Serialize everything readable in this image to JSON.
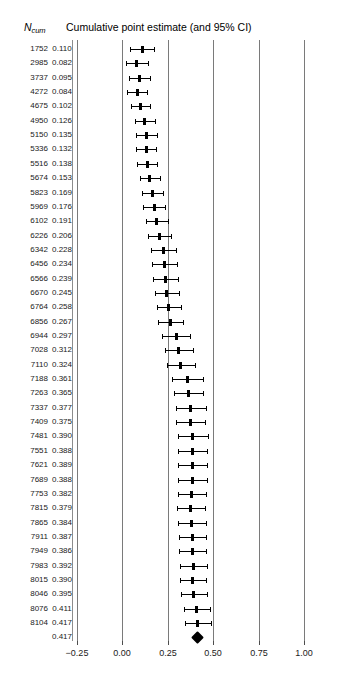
{
  "header": {
    "ncum_main": "N",
    "ncum_sub": "cum",
    "title": "Cumulative point estimate (and 95% CI)"
  },
  "axis": {
    "ticks": [
      "−0.25",
      "0.00",
      "0.25",
      "0.50",
      "0.75",
      "1.00"
    ],
    "tick_values": [
      -0.25,
      0.0,
      0.25,
      0.5,
      0.75,
      1.0
    ]
  },
  "columns": {
    "n_header": "Ncum",
    "estimate_header": "Cumulative point estimate (and 95% CI)"
  },
  "chart_data": {
    "type": "forest",
    "title": "Cumulative point estimate (and 95% CI)",
    "xlabel": "",
    "ylabel": "",
    "xlim": [
      -0.38,
      1.12
    ],
    "grid": true,
    "legend": "none",
    "x_ticks": [
      -0.25,
      0.0,
      0.25,
      0.5,
      0.75,
      1.0
    ],
    "x_tick_labels": [
      "−0.25",
      "0.00",
      "0.25",
      "0.50",
      "0.75",
      "1.00"
    ],
    "columns": [
      "N_cum",
      "estimate",
      "ci_low",
      "ci_high"
    ],
    "rows": [
      {
        "n": "1752",
        "estimate": "0.110",
        "value": 0.11,
        "ci_low": 0.042,
        "ci_high": 0.178
      },
      {
        "n": "2985",
        "estimate": "0.082",
        "value": 0.082,
        "ci_low": 0.022,
        "ci_high": 0.142
      },
      {
        "n": "3737",
        "estimate": "0.095",
        "value": 0.095,
        "ci_low": 0.038,
        "ci_high": 0.152
      },
      {
        "n": "4272",
        "estimate": "0.084",
        "value": 0.084,
        "ci_low": 0.029,
        "ci_high": 0.139
      },
      {
        "n": "4675",
        "estimate": "0.102",
        "value": 0.102,
        "ci_low": 0.049,
        "ci_high": 0.155
      },
      {
        "n": "4950",
        "estimate": "0.126",
        "value": 0.126,
        "ci_low": 0.069,
        "ci_high": 0.183
      },
      {
        "n": "5150",
        "estimate": "0.135",
        "value": 0.135,
        "ci_low": 0.079,
        "ci_high": 0.191
      },
      {
        "n": "5336",
        "estimate": "0.132",
        "value": 0.132,
        "ci_low": 0.078,
        "ci_high": 0.186
      },
      {
        "n": "5516",
        "estimate": "0.138",
        "value": 0.138,
        "ci_low": 0.085,
        "ci_high": 0.191
      },
      {
        "n": "5674",
        "estimate": "0.153",
        "value": 0.153,
        "ci_low": 0.098,
        "ci_high": 0.208
      },
      {
        "n": "5823",
        "estimate": "0.169",
        "value": 0.169,
        "ci_low": 0.111,
        "ci_high": 0.227
      },
      {
        "n": "5969",
        "estimate": "0.176",
        "value": 0.176,
        "ci_low": 0.118,
        "ci_high": 0.234
      },
      {
        "n": "6102",
        "estimate": "0.191",
        "value": 0.191,
        "ci_low": 0.13,
        "ci_high": 0.252
      },
      {
        "n": "6226",
        "estimate": "0.206",
        "value": 0.206,
        "ci_low": 0.143,
        "ci_high": 0.269
      },
      {
        "n": "6342",
        "estimate": "0.228",
        "value": 0.228,
        "ci_low": 0.161,
        "ci_high": 0.295
      },
      {
        "n": "6456",
        "estimate": "0.234",
        "value": 0.234,
        "ci_low": 0.167,
        "ci_high": 0.301
      },
      {
        "n": "6566",
        "estimate": "0.239",
        "value": 0.239,
        "ci_low": 0.173,
        "ci_high": 0.305
      },
      {
        "n": "6670",
        "estimate": "0.245",
        "value": 0.245,
        "ci_low": 0.179,
        "ci_high": 0.311
      },
      {
        "n": "6764",
        "estimate": "0.258",
        "value": 0.258,
        "ci_low": 0.19,
        "ci_high": 0.326
      },
      {
        "n": "6856",
        "estimate": "0.267",
        "value": 0.267,
        "ci_low": 0.198,
        "ci_high": 0.336
      },
      {
        "n": "6944",
        "estimate": "0.297",
        "value": 0.297,
        "ci_low": 0.222,
        "ci_high": 0.372
      },
      {
        "n": "7028",
        "estimate": "0.312",
        "value": 0.312,
        "ci_low": 0.236,
        "ci_high": 0.388
      },
      {
        "n": "7110",
        "estimate": "0.324",
        "value": 0.324,
        "ci_low": 0.247,
        "ci_high": 0.401
      },
      {
        "n": "7188",
        "estimate": "0.361",
        "value": 0.361,
        "ci_low": 0.277,
        "ci_high": 0.445
      },
      {
        "n": "7263",
        "estimate": "0.365",
        "value": 0.365,
        "ci_low": 0.283,
        "ci_high": 0.447
      },
      {
        "n": "7337",
        "estimate": "0.377",
        "value": 0.377,
        "ci_low": 0.295,
        "ci_high": 0.459
      },
      {
        "n": "7409",
        "estimate": "0.375",
        "value": 0.375,
        "ci_low": 0.295,
        "ci_high": 0.455
      },
      {
        "n": "7481",
        "estimate": "0.390",
        "value": 0.39,
        "ci_low": 0.308,
        "ci_high": 0.472
      },
      {
        "n": "7551",
        "estimate": "0.388",
        "value": 0.388,
        "ci_low": 0.308,
        "ci_high": 0.468
      },
      {
        "n": "7621",
        "estimate": "0.389",
        "value": 0.389,
        "ci_low": 0.31,
        "ci_high": 0.468
      },
      {
        "n": "7689",
        "estimate": "0.388",
        "value": 0.388,
        "ci_low": 0.31,
        "ci_high": 0.466
      },
      {
        "n": "7753",
        "estimate": "0.382",
        "value": 0.382,
        "ci_low": 0.305,
        "ci_high": 0.459
      },
      {
        "n": "7815",
        "estimate": "0.379",
        "value": 0.379,
        "ci_low": 0.304,
        "ci_high": 0.454
      },
      {
        "n": "7865",
        "estimate": "0.384",
        "value": 0.384,
        "ci_low": 0.309,
        "ci_high": 0.459
      },
      {
        "n": "7911",
        "estimate": "0.387",
        "value": 0.387,
        "ci_low": 0.313,
        "ci_high": 0.461
      },
      {
        "n": "7949",
        "estimate": "0.386",
        "value": 0.386,
        "ci_low": 0.313,
        "ci_high": 0.459
      },
      {
        "n": "7983",
        "estimate": "0.392",
        "value": 0.392,
        "ci_low": 0.319,
        "ci_high": 0.465
      },
      {
        "n": "8015",
        "estimate": "0.390",
        "value": 0.39,
        "ci_low": 0.318,
        "ci_high": 0.462
      },
      {
        "n": "8046",
        "estimate": "0.395",
        "value": 0.395,
        "ci_low": 0.324,
        "ci_high": 0.466
      },
      {
        "n": "8076",
        "estimate": "0.411",
        "value": 0.411,
        "ci_low": 0.338,
        "ci_high": 0.484
      },
      {
        "n": "8104",
        "estimate": "0.417",
        "value": 0.417,
        "ci_low": 0.344,
        "ci_high": 0.49
      }
    ],
    "summary": {
      "n": "",
      "estimate": "0.417",
      "value": 0.417,
      "ci_low": 0.344,
      "ci_high": 0.49
    }
  }
}
